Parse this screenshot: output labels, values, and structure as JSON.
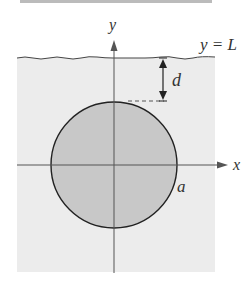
{
  "figure": {
    "axis_labels": {
      "x": "x",
      "y": "y"
    },
    "surface_label": "y = L",
    "depth_label": "d",
    "radius_label": "a",
    "colors": {
      "fluid": "#ececec",
      "disk": "#c8c8c8",
      "stroke": "#333333",
      "axis": "#555555"
    }
  }
}
